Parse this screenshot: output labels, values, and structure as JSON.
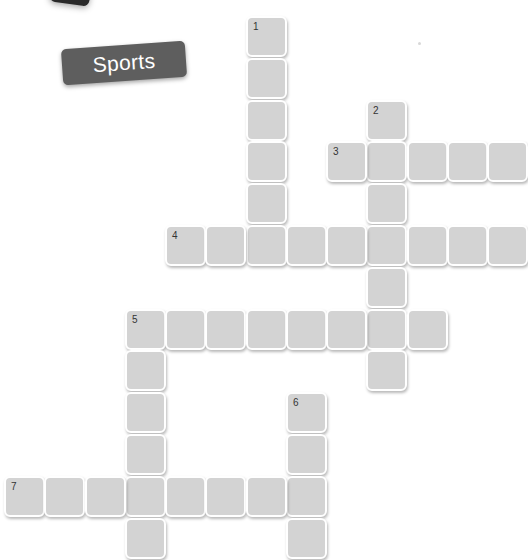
{
  "title": "Sports",
  "colors": {
    "badge_bg": "#5e5e5e",
    "badge_text": "#ffffff",
    "cell_fill": "#d3d3d3",
    "cell_border": "#ffffff",
    "number_text": "#333333",
    "background": "#ffffff"
  },
  "grid": {
    "origin_x": 4,
    "origin_y": 16,
    "pitch_x": 40.25,
    "pitch_y": 41.8
  },
  "words": [
    {
      "number": "1",
      "direction": "down",
      "col": 6,
      "row": 0,
      "length": 6
    },
    {
      "number": "2",
      "direction": "down",
      "col": 9,
      "row": 2,
      "length": 7
    },
    {
      "number": "3",
      "direction": "across",
      "col": 8,
      "row": 3,
      "length": 5
    },
    {
      "number": "4",
      "direction": "across",
      "col": 4,
      "row": 5,
      "length": 9
    },
    {
      "number": "5",
      "direction": "across",
      "col": 3,
      "row": 7,
      "length": 8
    },
    {
      "number": "5",
      "direction": "down",
      "col": 3,
      "row": 7,
      "length": 6
    },
    {
      "number": "6",
      "direction": "down",
      "col": 7,
      "row": 9,
      "length": 4
    },
    {
      "number": "7",
      "direction": "across",
      "col": 0,
      "row": 11,
      "length": 8
    }
  ]
}
